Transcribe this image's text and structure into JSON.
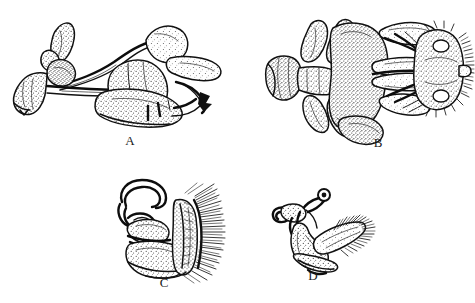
{
  "figure": {
    "type": "scientific-illustration-plate",
    "background_color": "#ffffff",
    "ink_color": "#111111",
    "width": 475,
    "height": 303,
    "style": "stippled pen-and-ink line drawing"
  },
  "panels": [
    {
      "id": "A",
      "label": "A",
      "description": "Lateral view of male genitalic capsule with elongate apodeme, fan-shaped basal plate, paired lobes and sclerotized hook at right",
      "label_x": 130,
      "label_y": 141,
      "bounds": {
        "x": 8,
        "y": 18,
        "width": 222,
        "height": 118
      }
    },
    {
      "id": "B",
      "label": "B",
      "description": "Dorsal view of the same capsule showing bilateral symmetry, trumpet-shaped basal apodeme at left and spinose apical margin at right",
      "label_x": 378,
      "label_y": 143,
      "bounds": {
        "x": 262,
        "y": 16,
        "width": 200,
        "height": 125
      }
    },
    {
      "id": "C",
      "label": "C",
      "description": "Lateral view of sclerite bearing a dense comb of long setae along the posterior margin and a looped anterior apodeme",
      "label_x": 164,
      "label_y": 277,
      "bounds": {
        "x": 108,
        "y": 176,
        "width": 118,
        "height": 95
      }
    },
    {
      "id": "D",
      "label": "D",
      "description": "Lateral view of a smaller sclerite with a plumose setose lobe directed posteriorly and a coiled anterior process",
      "label_x": 313,
      "label_y": 275,
      "bounds": {
        "x": 268,
        "y": 186,
        "width": 100,
        "height": 82
      }
    }
  ]
}
